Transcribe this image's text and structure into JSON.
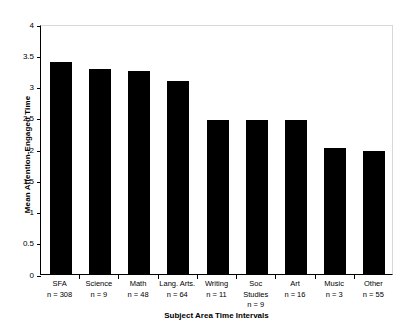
{
  "chart_data": {
    "type": "bar",
    "title": "",
    "xlabel": "Subject  Area  Time Intervals",
    "ylabel": "Mean Attention-Engaged Time",
    "categories": [
      "SFA",
      "Science",
      "Math",
      "Lang. Arts.",
      "Writing",
      "Soc Studies",
      "Art",
      "Music",
      "Other"
    ],
    "category_lines": [
      [
        "SFA"
      ],
      [
        "Science"
      ],
      [
        "Math"
      ],
      [
        "Lang. Arts."
      ],
      [
        "Writing"
      ],
      [
        "Soc",
        "Studies"
      ],
      [
        "Art"
      ],
      [
        "Music"
      ],
      [
        "Other"
      ]
    ],
    "n_labels": [
      "n = 308",
      "n = 9",
      "n = 48",
      "n = 64",
      "n = 11",
      "n = 9",
      "n = 16",
      "n = 3",
      "n = 55"
    ],
    "n_values": [
      308,
      9,
      48,
      64,
      11,
      9,
      16,
      3,
      55
    ],
    "values": [
      3.39,
      3.28,
      3.25,
      3.09,
      2.47,
      2.46,
      2.46,
      2.02,
      1.97
    ],
    "ylim": [
      0,
      4
    ],
    "yticks": [
      0,
      0.5,
      1,
      1.5,
      2,
      2.5,
      3,
      3.5,
      4
    ],
    "ytick_labels": [
      "0",
      "0.5",
      "1",
      "1.5",
      "2",
      "2.5",
      "3",
      "3.5",
      "4"
    ],
    "grid": false,
    "legend": "none",
    "bar_color": "#000000",
    "background_color": "#ffffff"
  }
}
